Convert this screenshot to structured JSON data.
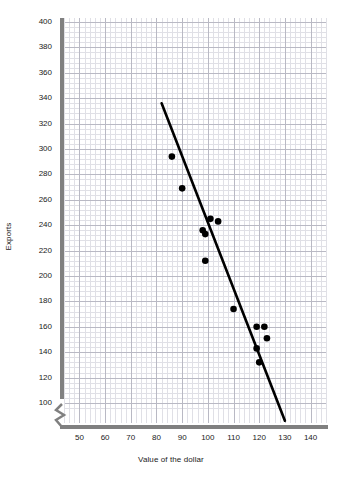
{
  "chart_data": {
    "type": "scatter",
    "title": "",
    "xlabel": "Value of the dollar",
    "ylabel": "Exports",
    "xlim": [
      44,
      146
    ],
    "ylim": [
      92,
      400
    ],
    "xticks": [
      50,
      60,
      70,
      80,
      90,
      100,
      110,
      120,
      130,
      140
    ],
    "yticks": [
      100,
      120,
      140,
      160,
      180,
      200,
      220,
      240,
      260,
      280,
      300,
      320,
      340,
      360,
      380,
      400
    ],
    "grid": true,
    "grid_style": "graph-paper, minor every 2 units, major every 10 units",
    "y_axis_break": true,
    "legend": "none",
    "points": [
      {
        "x": 86,
        "y": 294
      },
      {
        "x": 90,
        "y": 269
      },
      {
        "x": 101,
        "y": 245
      },
      {
        "x": 104,
        "y": 243
      },
      {
        "x": 98,
        "y": 236
      },
      {
        "x": 99,
        "y": 233
      },
      {
        "x": 99,
        "y": 212
      },
      {
        "x": 110,
        "y": 174
      },
      {
        "x": 119,
        "y": 160
      },
      {
        "x": 122,
        "y": 160
      },
      {
        "x": 123,
        "y": 151
      },
      {
        "x": 119,
        "y": 143
      },
      {
        "x": 120,
        "y": 132
      }
    ],
    "series": [
      {
        "name": "Exports vs Value of the dollar",
        "marker": "filled-circle",
        "marker_color": "#000000",
        "x": [
          86,
          90,
          101,
          104,
          98,
          99,
          99,
          110,
          119,
          122,
          123,
          119,
          120
        ],
        "y": [
          294,
          269,
          245,
          243,
          236,
          233,
          212,
          174,
          160,
          160,
          151,
          143,
          132
        ]
      }
    ],
    "trendline": {
      "type": "linear-fit",
      "color": "#000000",
      "x_start": 82,
      "y_start": 336,
      "x_end": 130,
      "y_end": 86
    },
    "colors": {
      "marker": "#000000",
      "trendline": "#000000",
      "axis": "#808080",
      "grid_minor": "#e0e0e6",
      "grid_major": "#b9b9c4",
      "text": "#1a1a1a",
      "background": "#ffffff"
    }
  },
  "axes": {
    "x_title": "Value of the dollar",
    "y_title": "Exports",
    "x_tick_labels": [
      "50",
      "60",
      "70",
      "80",
      "90",
      "100",
      "110",
      "120",
      "130",
      "140"
    ],
    "y_tick_labels": [
      "100",
      "120",
      "140",
      "160",
      "180",
      "200",
      "220",
      "240",
      "260",
      "280",
      "300",
      "320",
      "340",
      "360",
      "380",
      "400"
    ]
  }
}
